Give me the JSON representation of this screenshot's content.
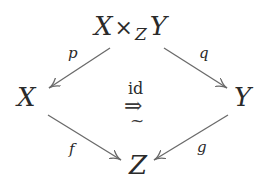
{
  "diagram": {
    "type": "commutative-square",
    "objects": {
      "top": {
        "left": "X",
        "op": "×",
        "sub": "Z",
        "right": "Y"
      },
      "left": "X",
      "right": "Y",
      "bottom": "Z"
    },
    "arrows": [
      {
        "name": "p",
        "from": "X ×_Z Y",
        "to": "X",
        "label": "p"
      },
      {
        "name": "q",
        "from": "X ×_Z Y",
        "to": "Y",
        "label": "q"
      },
      {
        "name": "f",
        "from": "X",
        "to": "Z",
        "label": "f"
      },
      {
        "name": "g",
        "from": "Y",
        "to": "Z",
        "label": "g"
      }
    ],
    "center": {
      "label_top": "id",
      "symbol": "⇒",
      "label_bottom": "~"
    },
    "colors": {
      "text": "#2a2a2a",
      "arrow": "#6a6a6a",
      "background": "#ffffff"
    }
  }
}
